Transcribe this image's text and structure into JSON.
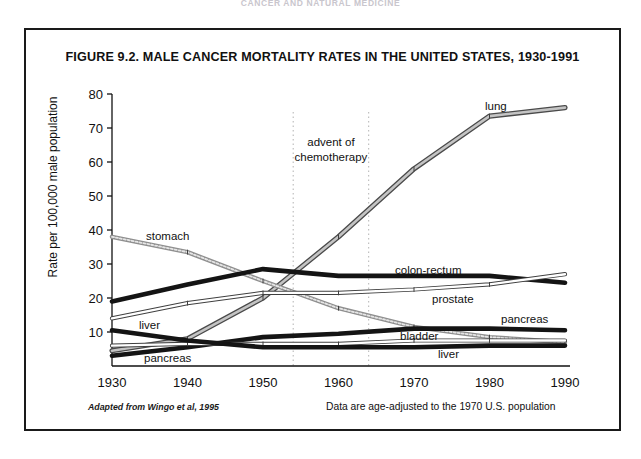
{
  "running_head": "CANCER AND NATURAL MEDICINE",
  "figure": {
    "title": "FIGURE 9.2.  MALE CANCER MORTALITY RATES IN THE UNITED STATES, 1930-1991",
    "source_note": "Adapted from Wingo et al, 1995",
    "data_note": "Data are age-adjusted to the 1970 U.S. population"
  },
  "chart_data": {
    "type": "line",
    "title": "FIGURE 9.2.  MALE CANCER MORTALITY RATES IN THE UNITED STATES, 1930-1991",
    "xlabel": "",
    "ylabel": "Rate per 100,000 male population",
    "x": [
      1930,
      1940,
      1950,
      1960,
      1970,
      1980,
      1990
    ],
    "xlim": [
      1930,
      1990
    ],
    "ylim": [
      0,
      80
    ],
    "xticks": [
      1930,
      1940,
      1950,
      1960,
      1970,
      1980,
      1990
    ],
    "xtick_labels": [
      "1930",
      "1940",
      "1950",
      "1960",
      "1970",
      "1980",
      "1990"
    ],
    "yticks": [
      10,
      20,
      30,
      40,
      50,
      60,
      70,
      80
    ],
    "ytick_labels": [
      "10",
      "20",
      "30",
      "40",
      "50",
      "60",
      "70",
      "80"
    ],
    "grid": false,
    "legend_position": "inline-labels",
    "series": [
      {
        "name": "lung",
        "label": "lung",
        "color": "#8a8a8a",
        "style": "double-band",
        "values": [
          4.5,
          8.0,
          20.0,
          38.0,
          58.0,
          73.5,
          76.0
        ]
      },
      {
        "name": "stomach",
        "label": "stomach",
        "color": "#9a9a9a",
        "style": "dotted-band",
        "values": [
          38.0,
          33.5,
          25.0,
          17.0,
          11.5,
          8.5,
          7.0
        ]
      },
      {
        "name": "colon-rectum",
        "label": "colon-rectum",
        "color": "#141414",
        "style": "thick-solid",
        "values": [
          19.0,
          24.0,
          28.5,
          26.5,
          26.5,
          26.5,
          24.5
        ]
      },
      {
        "name": "prostate",
        "label": "prostate",
        "color": "#7d7d7d",
        "style": "thin-band",
        "values": [
          14.0,
          18.5,
          21.5,
          21.5,
          22.5,
          24.0,
          27.0
        ]
      },
      {
        "name": "pancreas",
        "label": "pancreas",
        "color": "#141414",
        "style": "thick-solid",
        "values": [
          3.0,
          5.5,
          8.5,
          9.5,
          11.0,
          11.0,
          10.5
        ]
      },
      {
        "name": "bladder",
        "label": "bladder",
        "color": "#6e6e6e",
        "style": "thin-band",
        "values": [
          6.0,
          6.5,
          6.5,
          6.5,
          7.5,
          7.5,
          7.5
        ]
      },
      {
        "name": "liver",
        "label": "liver",
        "color": "#141414",
        "style": "thick-solid",
        "values": [
          10.5,
          7.5,
          5.5,
          5.5,
          5.5,
          6.0,
          6.0
        ]
      }
    ],
    "annotations": [
      {
        "name": "advent-of-chemotherapy",
        "text_line_1": "advent of",
        "text_line_2": "chemotherapy",
        "x_start": 1954,
        "x_end": 1964
      }
    ],
    "inline_labels": [
      {
        "name": "lung",
        "text": "lung",
        "x": 483,
        "y": 108
      },
      {
        "name": "stomach",
        "text": "stomach",
        "x": 144,
        "y": 238
      },
      {
        "name": "colon-rectum",
        "text": "colon-rectum",
        "x": 393,
        "y": 272
      },
      {
        "name": "prostate",
        "text": "prostate",
        "x": 430,
        "y": 301
      },
      {
        "name": "pancreas-right",
        "text": "pancreas",
        "x": 499,
        "y": 321
      },
      {
        "name": "bladder",
        "text": "bladder",
        "x": 398,
        "y": 338
      },
      {
        "name": "liver-right",
        "text": "liver",
        "x": 436,
        "y": 356
      },
      {
        "name": "liver-left",
        "text": "liver",
        "x": 137,
        "y": 327
      },
      {
        "name": "pancreas-left",
        "text": "pancreas",
        "x": 142,
        "y": 360
      }
    ]
  }
}
